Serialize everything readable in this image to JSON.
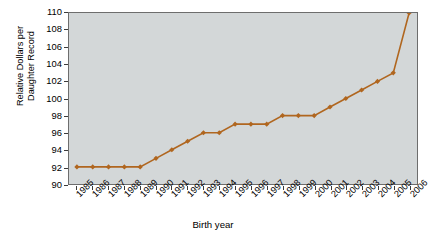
{
  "chart_data": {
    "type": "line",
    "title": "",
    "xlabel": "Birth year",
    "ylabel": "Relative Dollars per Daughter Record",
    "categories": [
      "1985",
      "1986",
      "1987",
      "1988",
      "1989",
      "1990",
      "1991",
      "1992",
      "1993",
      "1994",
      "1995",
      "1996",
      "1997",
      "1998",
      "1999",
      "2000",
      "2001",
      "2002",
      "2003",
      "2004",
      "2005",
      "2006"
    ],
    "values": [
      92,
      92,
      92,
      92,
      92,
      93,
      94,
      95,
      96,
      96,
      97,
      97,
      97,
      98,
      98,
      98,
      99,
      100,
      101,
      102,
      103,
      110
    ],
    "series": [
      {
        "name": "Relative Dollars per Daughter Record",
        "values": [
          92,
          92,
          92,
          92,
          92,
          93,
          94,
          95,
          96,
          96,
          97,
          97,
          97,
          98,
          98,
          98,
          99,
          100,
          101,
          102,
          103,
          110
        ]
      }
    ],
    "ylim": [
      90,
      110
    ],
    "ytick_step": 2,
    "yticks": [
      90,
      92,
      94,
      96,
      98,
      100,
      102,
      104,
      106,
      108,
      110
    ],
    "grid": false,
    "legend": "none",
    "line_color": "#b0661f",
    "marker_color": "#b0661f",
    "marker_shape": "diamond",
    "plot_background": "#d3d7d8",
    "axis_color": "#5a5a5a",
    "page_background": "#ffffff"
  },
  "axis": {
    "y_title_line1": "Relative Dollars per",
    "y_title_line2": "Daughter Record",
    "x_title": "Birth year"
  }
}
